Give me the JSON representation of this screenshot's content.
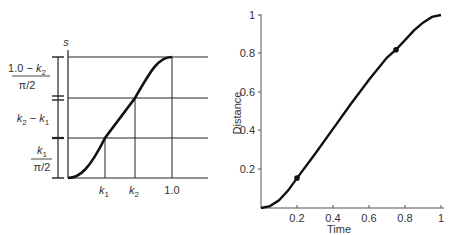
{
  "left_diagram": {
    "y_axis_label": "s",
    "x_ticks": [
      {
        "base": "k",
        "sub": "1"
      },
      {
        "base": "k",
        "sub": "2"
      },
      {
        "text": "1.0"
      }
    ],
    "brackets": [
      {
        "num_pre": "1.0 − ",
        "num_var": "k",
        "num_sub": "2",
        "den": "π/2"
      },
      {
        "a_var": "k",
        "a_sub": "2",
        "minus": " − ",
        "b_var": "k",
        "b_sub": "1"
      },
      {
        "num_var": "k",
        "num_sub": "1",
        "den": "π/2"
      }
    ]
  },
  "chart_data": {
    "type": "line",
    "title": "",
    "xlabel": "Time",
    "ylabel": "Distance",
    "xlim": [
      0,
      1
    ],
    "ylim": [
      0,
      1
    ],
    "x_ticks": [
      "0.2",
      "0.4",
      "0.6",
      "0.8",
      "1"
    ],
    "y_ticks": [
      "0.2",
      "0.4",
      "0.6",
      "0.8",
      "1"
    ],
    "grid": false,
    "series": [
      {
        "name": "ease-in/ease-out distance",
        "x": [
          0,
          0.05,
          0.1,
          0.15,
          0.2,
          0.3,
          0.4,
          0.5,
          0.6,
          0.7,
          0.75,
          0.8,
          0.85,
          0.9,
          0.95,
          1.0
        ],
        "y": [
          0,
          0.01,
          0.04,
          0.09,
          0.155,
          0.28,
          0.41,
          0.54,
          0.665,
          0.78,
          0.82,
          0.87,
          0.92,
          0.96,
          0.99,
          1.0
        ]
      }
    ],
    "markers": [
      {
        "x": 0.2,
        "y": 0.155
      },
      {
        "x": 0.75,
        "y": 0.82
      }
    ]
  }
}
